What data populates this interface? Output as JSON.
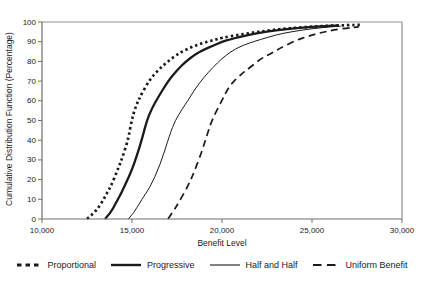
{
  "chart_data": {
    "type": "line",
    "title": "",
    "xlabel": "Benefit Level",
    "ylabel": "Cumulative Distribution Function (Percentage)",
    "xlim": [
      10000,
      30000
    ],
    "ylim": [
      0,
      100
    ],
    "grid": false,
    "legend_position": "bottom",
    "line_color": "#1a1a1a",
    "frame_color": "#8f8f8f",
    "axis_color": "#6e6e6e",
    "x_ticks": [
      {
        "value": 10000,
        "label": "10,000"
      },
      {
        "value": 15000,
        "label": "15,000"
      },
      {
        "value": 20000,
        "label": "20,000"
      },
      {
        "value": 25000,
        "label": "25,000"
      },
      {
        "value": 30000,
        "label": "30,000"
      }
    ],
    "y_ticks": [
      {
        "value": 0,
        "label": "0"
      },
      {
        "value": 10,
        "label": "10"
      },
      {
        "value": 20,
        "label": "20"
      },
      {
        "value": 30,
        "label": "30"
      },
      {
        "value": 40,
        "label": "40"
      },
      {
        "value": 50,
        "label": "50"
      },
      {
        "value": 60,
        "label": "60"
      },
      {
        "value": 70,
        "label": "70"
      },
      {
        "value": 80,
        "label": "80"
      },
      {
        "value": 90,
        "label": "90"
      },
      {
        "value": 100,
        "label": "100"
      }
    ],
    "series": [
      {
        "name": "Proportional",
        "line_style": "bold-dotted",
        "points": [
          [
            12500,
            0
          ],
          [
            12900,
            3
          ],
          [
            13300,
            8
          ],
          [
            13600,
            13
          ],
          [
            13900,
            18
          ],
          [
            14200,
            25
          ],
          [
            14500,
            32
          ],
          [
            14800,
            41
          ],
          [
            14980,
            50
          ],
          [
            15200,
            57
          ],
          [
            15500,
            63
          ],
          [
            16000,
            71
          ],
          [
            16500,
            76
          ],
          [
            17000,
            80
          ],
          [
            17500,
            83.5
          ],
          [
            18000,
            86
          ],
          [
            18500,
            88
          ],
          [
            19000,
            89.5
          ],
          [
            19500,
            90.7
          ],
          [
            20000,
            92
          ],
          [
            21000,
            93.6
          ],
          [
            22000,
            95
          ],
          [
            23000,
            96.2
          ],
          [
            24000,
            97
          ],
          [
            25000,
            97.6
          ],
          [
            26000,
            98.1
          ],
          [
            27000,
            98.4
          ],
          [
            27700,
            98.6
          ]
        ]
      },
      {
        "name": "Progressive",
        "line_style": "bold-solid",
        "points": [
          [
            13500,
            0
          ],
          [
            13800,
            3
          ],
          [
            14100,
            8
          ],
          [
            14400,
            13
          ],
          [
            14700,
            19
          ],
          [
            15000,
            25
          ],
          [
            15300,
            33
          ],
          [
            15600,
            42
          ],
          [
            15820,
            50
          ],
          [
            16100,
            56
          ],
          [
            16400,
            61
          ],
          [
            17000,
            70
          ],
          [
            17500,
            75.5
          ],
          [
            18000,
            80
          ],
          [
            18500,
            83.5
          ],
          [
            19000,
            86
          ],
          [
            19500,
            88
          ],
          [
            20000,
            90
          ],
          [
            20500,
            91.3
          ],
          [
            21000,
            92.5
          ],
          [
            22000,
            94.5
          ],
          [
            23000,
            95.8
          ],
          [
            24000,
            96.8
          ],
          [
            25000,
            97.5
          ],
          [
            26000,
            98
          ],
          [
            26500,
            98.2
          ]
        ]
      },
      {
        "name": "Half and Half",
        "line_style": "thin-solid",
        "points": [
          [
            14800,
            0
          ],
          [
            15100,
            3
          ],
          [
            15540,
            10
          ],
          [
            16000,
            16
          ],
          [
            16550,
            27
          ],
          [
            17100,
            43
          ],
          [
            17400,
            50
          ],
          [
            17800,
            56
          ],
          [
            18100,
            60
          ],
          [
            18500,
            66
          ],
          [
            19000,
            72
          ],
          [
            19500,
            77
          ],
          [
            20000,
            81.5
          ],
          [
            20500,
            85
          ],
          [
            21000,
            87.5
          ],
          [
            21500,
            89.3
          ],
          [
            22100,
            91
          ],
          [
            23000,
            93.5
          ],
          [
            24000,
            95.3
          ],
          [
            25000,
            96.6
          ],
          [
            26000,
            97.5
          ],
          [
            26600,
            97.9
          ]
        ]
      },
      {
        "name": "Uniform Benefit",
        "line_style": "dashed",
        "points": [
          [
            17000,
            0
          ],
          [
            17300,
            4
          ],
          [
            17570,
            8
          ],
          [
            18130,
            17
          ],
          [
            18500,
            25
          ],
          [
            18870,
            34
          ],
          [
            19150,
            42
          ],
          [
            19430,
            50
          ],
          [
            19980,
            60
          ],
          [
            20440,
            68
          ],
          [
            21000,
            73
          ],
          [
            21500,
            76.5
          ],
          [
            22100,
            81
          ],
          [
            22700,
            84
          ],
          [
            23300,
            87
          ],
          [
            24060,
            90.5
          ],
          [
            24800,
            92.8
          ],
          [
            25500,
            94.6
          ],
          [
            26200,
            96
          ],
          [
            27000,
            97
          ],
          [
            27600,
            97.5
          ]
        ]
      }
    ]
  }
}
